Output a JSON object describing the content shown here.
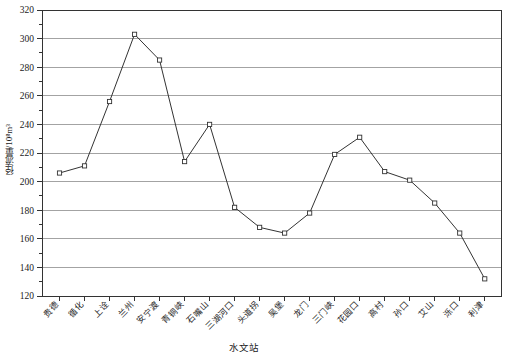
{
  "chart_data": {
    "type": "line",
    "title": "",
    "xlabel": "水文站",
    "ylabel": "径流量/10⁸m³",
    "ylabel_plain": "径流量/10^8m3",
    "categories": [
      "贵德",
      "循化",
      "上诠",
      "兰州",
      "安宁渡",
      "青铜峡",
      "石嘴山",
      "三湖河口",
      "头道拐",
      "吴堡",
      "龙门",
      "三门峡",
      "花园口",
      "高村",
      "孙口",
      "艾山",
      "泺口",
      "利津"
    ],
    "values": [
      206,
      211,
      256,
      303,
      285,
      214,
      240,
      182,
      168,
      164,
      178,
      219,
      231,
      207,
      201,
      185,
      164,
      132
    ],
    "ylim": [
      120,
      320
    ],
    "ytick_step": 20,
    "yminor_step": 10,
    "ytick_labels": [
      "320",
      "300",
      "280",
      "260",
      "240",
      "220",
      "200",
      "180",
      "160",
      "140",
      "120"
    ],
    "grid": true,
    "grid_axis": "y",
    "legend": "none",
    "marker": "square-open",
    "line_color": "#333333",
    "marker_color": "#333333",
    "grid_color": "#999999",
    "axis_color": "#333333",
    "series": [
      {
        "name": "径流量",
        "values": [
          206,
          211,
          256,
          303,
          285,
          214,
          240,
          182,
          168,
          164,
          178,
          219,
          231,
          207,
          201,
          185,
          164,
          132
        ]
      }
    ],
    "points": [
      {
        "station": "贵德",
        "value": 206
      },
      {
        "station": "循化",
        "value": 211
      },
      {
        "station": "上诠",
        "value": 256
      },
      {
        "station": "兰州",
        "value": 303
      },
      {
        "station": "安宁渡",
        "value": 285
      },
      {
        "station": "青铜峡",
        "value": 214
      },
      {
        "station": "石嘴山",
        "value": 240
      },
      {
        "station": "三湖河口",
        "value": 182
      },
      {
        "station": "头道拐",
        "value": 168
      },
      {
        "station": "吴堡",
        "value": 164
      },
      {
        "station": "龙门",
        "value": 178
      },
      {
        "station": "三门峡",
        "value": 219
      },
      {
        "station": "花园口",
        "value": 231
      },
      {
        "station": "高村",
        "value": 207
      },
      {
        "station": "孙口",
        "value": 201
      },
      {
        "station": "艾山",
        "value": 185
      },
      {
        "station": "泺口",
        "value": 164
      },
      {
        "station": "利津",
        "value": 132
      }
    ]
  }
}
